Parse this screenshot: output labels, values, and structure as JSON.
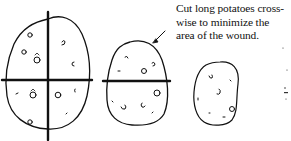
{
  "annotation": {
    "lines": [
      "Cut long potatoes cross-",
      "wise to minimize the",
      "area of the wound."
    ]
  },
  "figures": [
    {
      "name": "potato-quartered",
      "cuts": "cross (vertical + horizontal)"
    },
    {
      "name": "potato-halved",
      "cuts": "horizontal crosswise"
    },
    {
      "name": "potato-whole",
      "cuts": "none"
    }
  ],
  "colors": {
    "ink": "#111111",
    "background": "#ffffff"
  }
}
